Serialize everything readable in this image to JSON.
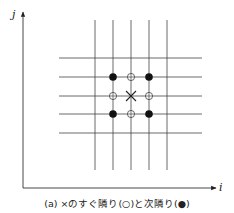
{
  "diagram": {
    "axes": {
      "x_label": "i",
      "y_label": "j"
    },
    "grid": {
      "vertical_lines_x": [
        95,
        113,
        131,
        149,
        167
      ],
      "horizontal_lines_y": [
        58,
        77,
        96,
        114,
        133
      ],
      "center": {
        "col": 2,
        "row": 2,
        "marker": "×"
      }
    },
    "nearest_neighbors": {
      "symbol": "○",
      "points": [
        [
          113,
          96
        ],
        [
          149,
          96
        ],
        [
          131,
          77
        ],
        [
          131,
          114
        ]
      ]
    },
    "next_nearest_neighbors": {
      "symbol": "●",
      "points": [
        [
          113,
          77
        ],
        [
          149,
          77
        ],
        [
          113,
          114
        ],
        [
          149,
          114
        ]
      ]
    },
    "caption": "(a) ×のすぐ隣り(○)と次隣り(●)"
  }
}
